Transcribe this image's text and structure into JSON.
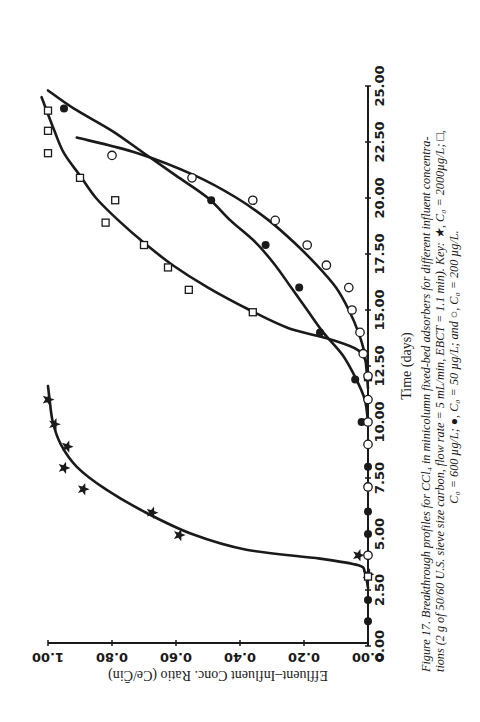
{
  "chart_data": {
    "type": "scatter",
    "orientation": "rotated 90 degrees counter-clockwise on page",
    "xlabel": "Time (days)",
    "ylabel": "Effluent–Influent Conc. Ratio (Ce/C̄in)",
    "xlim": [
      0,
      25
    ],
    "ylim": [
      0,
      1
    ],
    "x_ticks": [
      "0.00",
      "2.50",
      "5.00",
      "7.50",
      "10.00",
      "12.50",
      "15.00",
      "17.50",
      "20.00",
      "22.50",
      "25.00"
    ],
    "y_ticks": [
      "0.00",
      "0.20",
      "0.40",
      "0.60",
      "0.80",
      "1.00"
    ],
    "grid": false,
    "legend_position": "in caption",
    "series": [
      {
        "name": "C0 = 2000 µg/L",
        "marker": "star",
        "points": [
          [
            3.2,
            0.0
          ],
          [
            4.05,
            0.03
          ],
          [
            4.95,
            0.59
          ],
          [
            5.95,
            0.675
          ],
          [
            7.0,
            0.89
          ],
          [
            7.95,
            0.95
          ],
          [
            8.9,
            0.94
          ],
          [
            9.9,
            0.98
          ],
          [
            11.0,
            1.0
          ]
        ],
        "curve": [
          [
            2.6,
            0.0
          ],
          [
            3.3,
            0.01
          ],
          [
            3.6,
            0.03
          ],
          [
            3.9,
            0.15
          ],
          [
            4.3,
            0.38
          ],
          [
            5.0,
            0.55
          ],
          [
            6.0,
            0.7
          ],
          [
            7.0,
            0.82
          ],
          [
            8.0,
            0.91
          ],
          [
            9.0,
            0.96
          ],
          [
            10.0,
            0.985
          ],
          [
            11.0,
            0.995
          ],
          [
            11.6,
            1.0
          ]
        ]
      },
      {
        "name": "C0 = 600 µg/L",
        "marker": "square",
        "points": [
          [
            3.1,
            0.0
          ],
          [
            12.0,
            0.0
          ],
          [
            14.9,
            0.36
          ],
          [
            15.9,
            0.56
          ],
          [
            16.9,
            0.625
          ],
          [
            17.9,
            0.7
          ],
          [
            18.9,
            0.82
          ],
          [
            19.9,
            0.79
          ],
          [
            20.9,
            0.9
          ],
          [
            22.0,
            1.0
          ],
          [
            23.0,
            1.0
          ],
          [
            23.9,
            1.0
          ]
        ],
        "curve": [
          [
            12.5,
            0.0
          ],
          [
            13.2,
            0.03
          ],
          [
            13.7,
            0.12
          ],
          [
            14.2,
            0.25
          ],
          [
            15.0,
            0.37
          ],
          [
            16.0,
            0.5
          ],
          [
            17.0,
            0.61
          ],
          [
            18.0,
            0.7
          ],
          [
            19.0,
            0.78
          ],
          [
            20.0,
            0.85
          ],
          [
            21.0,
            0.9
          ],
          [
            22.0,
            0.95
          ],
          [
            23.0,
            0.98
          ],
          [
            24.5,
            1.02
          ]
        ]
      },
      {
        "name": "C0 = 50 µg/L",
        "marker": "filled-circle",
        "points": [
          [
            1.1,
            0.0
          ],
          [
            2.05,
            0.0
          ],
          [
            5.0,
            0.0
          ],
          [
            6.0,
            0.0
          ],
          [
            8.0,
            0.0
          ],
          [
            10.0,
            0.02
          ],
          [
            11.9,
            0.04
          ],
          [
            14.0,
            0.15
          ],
          [
            16.0,
            0.215
          ],
          [
            17.9,
            0.32
          ],
          [
            19.9,
            0.49
          ],
          [
            24.0,
            0.95
          ]
        ],
        "curve": [
          [
            10.0,
            0.0
          ],
          [
            11.0,
            0.01
          ],
          [
            12.0,
            0.04
          ],
          [
            13.0,
            0.08
          ],
          [
            14.0,
            0.14
          ],
          [
            15.0,
            0.19
          ],
          [
            16.0,
            0.24
          ],
          [
            17.0,
            0.29
          ],
          [
            18.0,
            0.35
          ],
          [
            19.0,
            0.43
          ],
          [
            20.0,
            0.5
          ],
          [
            21.0,
            0.6
          ],
          [
            22.0,
            0.7
          ],
          [
            23.0,
            0.8
          ],
          [
            24.0,
            0.92
          ],
          [
            24.8,
            1.0
          ]
        ]
      },
      {
        "name": "C0 = 200 µg/L",
        "marker": "open-circle",
        "points": [
          [
            4.05,
            0.0
          ],
          [
            7.1,
            0.0
          ],
          [
            9.0,
            0.0
          ],
          [
            10.0,
            0.0
          ],
          [
            11.0,
            0.0
          ],
          [
            12.05,
            0.0
          ],
          [
            13.05,
            0.015
          ],
          [
            14.0,
            0.025
          ],
          [
            15.0,
            0.05
          ],
          [
            16.0,
            0.06
          ],
          [
            17.0,
            0.13
          ],
          [
            17.9,
            0.19
          ],
          [
            19.0,
            0.29
          ],
          [
            19.9,
            0.36
          ],
          [
            20.9,
            0.55
          ],
          [
            21.9,
            0.8
          ]
        ],
        "curve": [
          [
            11.5,
            0.0
          ],
          [
            13.0,
            0.01
          ],
          [
            14.0,
            0.03
          ],
          [
            15.0,
            0.06
          ],
          [
            16.0,
            0.1
          ],
          [
            17.0,
            0.16
          ],
          [
            18.0,
            0.23
          ],
          [
            19.0,
            0.31
          ],
          [
            20.0,
            0.41
          ],
          [
            21.0,
            0.54
          ],
          [
            22.0,
            0.72
          ],
          [
            22.7,
            0.91
          ]
        ]
      }
    ]
  },
  "figure": {
    "x_axis_title": "Time (days)",
    "y_axis_title": "Effluent–Influent Conc. Ratio (Ce/C̄in)",
    "caption_lines": [
      "Figure 17. Breakthrough profiles for CCl₄ in minicolumn fixed-bed adsorbers for different influent concentra-",
      "tions (2 g of 50/60 U.S. sieve size carbon, flow rate = 5 mL/min, EBCT = 1.1 min). Key: ★, C₀ = 2000µg/L; □,",
      "C₀ = 600 µg/L; ●, C₀ = 50 µg/L; and ○, C₀ = 200 µg/L."
    ]
  }
}
